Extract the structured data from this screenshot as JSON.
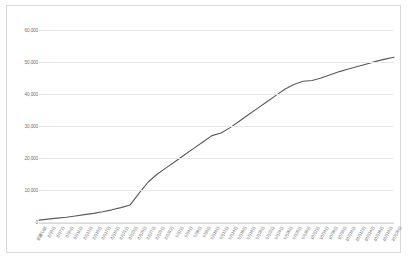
{
  "chart_data": {
    "type": "line",
    "title": "",
    "subtitle": "",
    "xlabel": "",
    "ylabel": "",
    "ylim": [
      0,
      60000
    ],
    "ytick_labels": [
      "60,000",
      "50,000",
      "40,000",
      "30,000",
      "20,000",
      "10,000",
      "0"
    ],
    "ytick_values": [
      60000,
      50000,
      40000,
      30000,
      20000,
      10000,
      0
    ],
    "grid": true,
    "legend": "none",
    "line_color": "#5a5a5a",
    "categories": [
      "前週以前",
      "8月5日",
      "8月7日",
      "8月9日",
      "8月11日",
      "8月13日",
      "8月15日",
      "8月17日",
      "8月19日",
      "8月21日",
      "8月23日",
      "8月25日",
      "8月27日",
      "8月29日",
      "8月31日",
      "9月2日",
      "9月4日",
      "9月6日",
      "9月8日",
      "9月10日",
      "9月12日",
      "9月14日",
      "9月16日",
      "9月18日",
      "9月20日",
      "9月22日",
      "9月24日",
      "9月26日",
      "9月28日",
      "9月30日",
      "10月2日",
      "10月4日",
      "10月6日",
      "10月8日",
      "10月10日",
      "10月12日",
      "10月14日",
      "10月16日",
      "10月18日",
      "10月20日"
    ],
    "values": [
      600,
      900,
      1200,
      1500,
      1900,
      2300,
      2700,
      3200,
      3800,
      4500,
      5300,
      9000,
      12500,
      15000,
      17000,
      19000,
      21000,
      23000,
      25000,
      27000,
      27800,
      29500,
      31500,
      33500,
      35500,
      37500,
      39500,
      41500,
      43000,
      44000,
      44200,
      45000,
      46000,
      47000,
      47800,
      48600,
      49400,
      50200,
      50900,
      51500
    ]
  },
  "frame": {
    "border_color": "#d9d9d9",
    "background": "#ffffff",
    "gridline_color": "#e8e8e8"
  }
}
